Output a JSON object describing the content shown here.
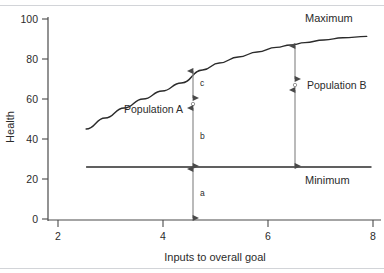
{
  "chart_data": {
    "type": "line",
    "title": "",
    "xlabel": "Inputs to overall goal",
    "ylabel": "Health",
    "xlim": [
      1.6,
      8.6
    ],
    "ylim": [
      0,
      103
    ],
    "grid": false,
    "legend": "none",
    "x_ticks": [
      "2",
      "4",
      "6",
      "8"
    ],
    "x_tick_values": [
      2,
      4,
      6,
      8
    ],
    "y_ticks": [
      "0",
      "20",
      "40",
      "60",
      "80",
      "100"
    ],
    "y_tick_values": [
      0,
      20,
      40,
      60,
      80,
      100
    ],
    "series": [
      {
        "name": "Maximum",
        "type": "line",
        "x": [
          2.4,
          2.8,
          3.2,
          3.6,
          4.0,
          4.4,
          4.85,
          5.2,
          5.6,
          6.0,
          6.4,
          6.7,
          7.0,
          7.4,
          7.8,
          8.3
        ],
        "values": [
          45,
          50.5,
          55.5,
          60,
          64,
          68,
          74.5,
          78,
          81,
          83.5,
          85.8,
          87,
          88.2,
          89.5,
          90.6,
          91.3
        ]
      },
      {
        "name": "Minimum",
        "type": "line",
        "x": [
          2.4,
          8.4
        ],
        "values": [
          26,
          26
        ]
      }
    ],
    "annotations": [
      {
        "name": "Maximum",
        "label": "Maximum",
        "x": 7.75,
        "y": 99
      },
      {
        "name": "Minimum",
        "label": "Minimum",
        "x": 7.75,
        "y": 21
      },
      {
        "name": "Population A",
        "label": "Population A",
        "x": 4.0,
        "y": 56,
        "marker_x": 4.85,
        "segments": [
          {
            "label": "a",
            "from": 0,
            "to": 26
          },
          {
            "label": "b",
            "from": 26,
            "to": 58
          },
          {
            "label": "c",
            "from": 60,
            "to": 74.5
          }
        ]
      },
      {
        "name": "Population B",
        "label": "Population B",
        "x": 7.1,
        "y": 68,
        "marker_x": 6.7,
        "segments": [
          {
            "label": "",
            "from": 26,
            "to": 65
          },
          {
            "label": "",
            "from": 69.5,
            "to": 87
          }
        ]
      }
    ],
    "colors": {
      "curve": "#2b2b2b",
      "axis": "#4a4a4a",
      "annotation": "#8c8c8c",
      "text": "#2b2b2b",
      "rule": "#d2d4d8",
      "background": "#ffffff"
    }
  }
}
